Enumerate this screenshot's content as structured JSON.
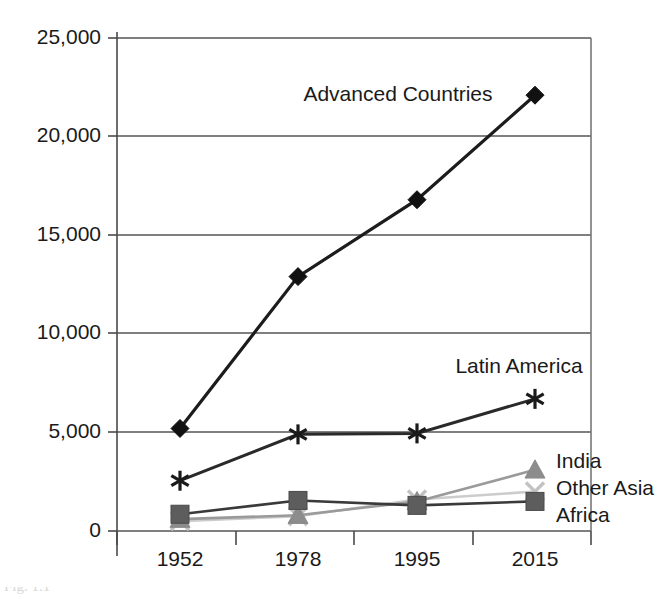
{
  "chart_data": {
    "type": "line",
    "title": "",
    "subtitle": "",
    "xlabel": "",
    "ylabel": "",
    "categories": [
      "1952",
      "1978",
      "1995",
      "2015"
    ],
    "ylim": [
      0,
      25000
    ],
    "yticks": [
      0,
      5000,
      10000,
      15000,
      20000,
      25000
    ],
    "ytick_labels": [
      "0",
      "5,000",
      "10,000",
      "15,000",
      "20,000",
      "25,000"
    ],
    "xtick_labels": [
      "1952",
      "1978",
      "1995",
      "2015"
    ],
    "grid": "horizontal",
    "legend_position": "inline-annotations",
    "series": [
      {
        "name": "Advanced Countries",
        "label": "Advanced Countries",
        "marker": "diamond",
        "color": "#111111",
        "line_color": "#1c1c1c",
        "values": [
          5200,
          12900,
          16800,
          22100
        ]
      },
      {
        "name": "Latin America",
        "label": "Latin America",
        "marker": "asterisk",
        "color": "#1a1a1a",
        "line_color": "#2a2a2a",
        "values": [
          2550,
          4900,
          4950,
          6700
        ]
      },
      {
        "name": "India",
        "label": "India",
        "marker": "triangle",
        "color": "#8c8c8c",
        "line_color": "#9a9a9a",
        "values": [
          600,
          800,
          1500,
          3100
        ]
      },
      {
        "name": "Other Asia",
        "label": "Other Asia",
        "marker": "x",
        "color": "#c2c2c2",
        "line_color": "#cccccc",
        "values": [
          500,
          750,
          1600,
          2000
        ]
      },
      {
        "name": "Africa",
        "label": "Africa",
        "marker": "square",
        "color": "#5d5d5d",
        "line_color": "#3a3a3a",
        "values": [
          850,
          1550,
          1300,
          1500
        ]
      }
    ],
    "annotations": [
      {
        "text": "Advanced Countries",
        "anchor": "middle",
        "x": 398,
        "y": 95
      },
      {
        "text": "Latin America",
        "anchor": "middle",
        "x": 519,
        "y": 367
      },
      {
        "text": "India",
        "anchor": "start",
        "x": 556,
        "y": 462
      },
      {
        "text": "Other Asia",
        "anchor": "start",
        "x": 556,
        "y": 489
      },
      {
        "text": "Africa",
        "anchor": "start",
        "x": 556,
        "y": 516
      }
    ]
  },
  "figure": {
    "caption_fragment": "Fig. 1.1"
  }
}
